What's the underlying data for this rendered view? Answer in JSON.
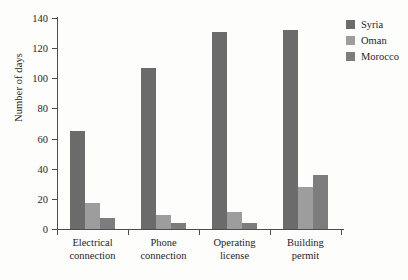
{
  "chart_data": {
    "type": "bar",
    "title": "",
    "subtitle": "",
    "xlabel": "",
    "ylabel": "Number of days",
    "ylim": [
      0,
      140
    ],
    "yticks": [
      0,
      20,
      40,
      60,
      80,
      100,
      120,
      140
    ],
    "ytick_labels": [
      "0",
      "20",
      "40",
      "60",
      "80",
      "100",
      "120",
      "140"
    ],
    "grid": false,
    "legend_position": "top-right",
    "categories": [
      "Electrical connection",
      "Phone connection",
      "Operating license",
      "Building permit"
    ],
    "category_lines": [
      [
        "Electrical",
        "connection"
      ],
      [
        "Phone",
        "connection"
      ],
      [
        "Operating",
        "license"
      ],
      [
        "Building",
        "permit"
      ]
    ],
    "series": [
      {
        "name": "Syria",
        "color": "#6b6b6b",
        "values": [
          65,
          107,
          131,
          132
        ]
      },
      {
        "name": "Oman",
        "color": "#9d9d9d",
        "values": [
          17,
          9,
          11,
          28
        ]
      },
      {
        "name": "Morocco",
        "color": "#7d7d7d",
        "values": [
          7,
          4,
          4,
          36
        ]
      }
    ]
  },
  "legend": {
    "items": [
      {
        "label": "Syria",
        "swatch": "legend-swatch-syria"
      },
      {
        "label": "Oman",
        "swatch": "legend-swatch-oman"
      },
      {
        "label": "Morocco",
        "swatch": "legend-swatch-morocco"
      }
    ]
  }
}
